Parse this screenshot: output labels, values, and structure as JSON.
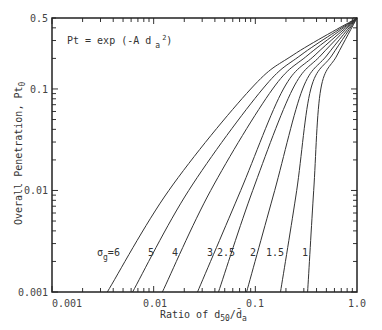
{
  "chart_data": {
    "type": "line",
    "title": "",
    "equation_annotation": "Pt = exp (-A d a 2)",
    "equation_parts": {
      "main": "Pt = exp (-A d",
      "sub": "a",
      "sup": "2",
      "close": ")"
    },
    "xlabel": "Ratio of d50/d̄a",
    "xlabel_parts": {
      "pre": "Ratio of d",
      "sub1": "50",
      "slash": "/",
      "dbar": "d̄",
      "sub2": "a"
    },
    "ylabel": "Overall Penetration, Pt0",
    "ylabel_parts": {
      "main": "Overall Penetration, Pt",
      "sub": "0"
    },
    "xscale": "log",
    "yscale": "log",
    "xlim": [
      0.001,
      1.0
    ],
    "ylim": [
      0.001,
      0.5
    ],
    "x_tick_labels": [
      "0.001",
      "0.01",
      "0.1",
      "1.0"
    ],
    "y_tick_labels": [
      "0.001",
      "0.01",
      "0.1",
      "0.5"
    ],
    "grid": false,
    "legend": "inline labels near bottom of curves",
    "series": [
      {
        "name": "σg=6",
        "label": "6",
        "points": [
          [
            0.0035,
            0.001
          ],
          [
            0.0141,
            0.01
          ],
          [
            0.09,
            0.1
          ],
          [
            0.235,
            0.216
          ],
          [
            1.0,
            0.5
          ]
        ]
      },
      {
        "name": "σg=5",
        "label": "5",
        "points": [
          [
            0.0062,
            0.001
          ],
          [
            0.0221,
            0.01
          ],
          [
            0.118,
            0.1
          ],
          [
            0.281,
            0.216
          ],
          [
            1.0,
            0.5
          ]
        ]
      },
      {
        "name": "σg=4",
        "label": "4",
        "points": [
          [
            0.0122,
            0.001
          ],
          [
            0.0364,
            0.01
          ],
          [
            0.148,
            0.1
          ],
          [
            0.33,
            0.216
          ],
          [
            1.0,
            0.5
          ]
        ]
      },
      {
        "name": "σg=3",
        "label": "3",
        "points": [
          [
            0.027,
            0.001
          ],
          [
            0.0718,
            0.01
          ],
          [
            0.189,
            0.1
          ],
          [
            0.387,
            0.216
          ],
          [
            1.0,
            0.5
          ]
        ]
      },
      {
        "name": "σg=2.5",
        "label": "2.5",
        "points": [
          [
            0.0434,
            0.001
          ],
          [
            0.0942,
            0.01
          ],
          [
            0.233,
            0.1
          ],
          [
            0.444,
            0.216
          ],
          [
            1.0,
            0.5
          ]
        ]
      },
      {
        "name": "σg=2",
        "label": "2",
        "points": [
          [
            0.0821,
            0.001
          ],
          [
            0.155,
            0.01
          ],
          [
            0.292,
            0.1
          ],
          [
            0.509,
            0.216
          ],
          [
            1.0,
            0.5
          ]
        ]
      },
      {
        "name": "σg=1.5",
        "label": "1.5",
        "points": [
          [
            0.177,
            0.001
          ],
          [
            0.255,
            0.01
          ],
          [
            0.351,
            0.1
          ],
          [
            0.57,
            0.216
          ],
          [
            1.0,
            0.5
          ]
        ]
      },
      {
        "name": "σg=1",
        "label": "1",
        "points": [
          [
            0.327,
            0.001
          ],
          [
            0.375,
            0.01
          ],
          [
            0.44,
            0.1
          ],
          [
            0.639,
            0.216
          ],
          [
            1.0,
            0.5
          ]
        ]
      }
    ],
    "curve_labels": [
      {
        "text": "σ",
        "sub": "g",
        "suffix": "=6",
        "x_px": 97,
        "y_px": 256
      },
      {
        "text": "5",
        "x_px": 148,
        "y_px": 256
      },
      {
        "text": "4",
        "x_px": 172,
        "y_px": 256
      },
      {
        "text": "3",
        "x_px": 207,
        "y_px": 256
      },
      {
        "text": "2.5",
        "x_px": 217,
        "y_px": 256
      },
      {
        "text": "2",
        "x_px": 250,
        "y_px": 256
      },
      {
        "text": "1.5",
        "x_px": 266,
        "y_px": 256
      },
      {
        "text": "1",
        "x_px": 302,
        "y_px": 256
      }
    ]
  }
}
